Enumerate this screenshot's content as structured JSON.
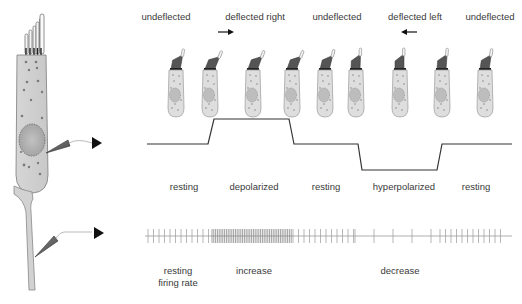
{
  "deflection_labels": [
    {
      "text": "undeflected",
      "x": 166
    },
    {
      "text": "deflected right",
      "x": 255
    },
    {
      "text": "undeflected",
      "x": 337
    },
    {
      "text": "deflected left",
      "x": 415
    },
    {
      "text": "undeflected",
      "x": 490
    }
  ],
  "deflection_arrows": [
    {
      "direction": "right",
      "x": 226,
      "y": 32
    },
    {
      "direction": "left",
      "x": 409,
      "y": 32
    }
  ],
  "potential_labels": [
    {
      "text": "resting",
      "x": 184
    },
    {
      "text": "depolarized",
      "x": 254
    },
    {
      "text": "resting",
      "x": 326
    },
    {
      "text": "hyperpolarized",
      "x": 404
    },
    {
      "text": "resting",
      "x": 476
    }
  ],
  "firing_labels": [
    {
      "text": "resting",
      "line2": "firing rate",
      "x": 178
    },
    {
      "text": "increase",
      "x": 254
    },
    {
      "text": "decrease",
      "x": 400
    }
  ],
  "receptor_potential_trace": {
    "baseline_y": 144,
    "depolarized_y": 119,
    "hyperpolarized_y": 170,
    "points": [
      [
        147,
        144
      ],
      [
        208,
        144
      ],
      [
        214,
        119
      ],
      [
        289,
        119
      ],
      [
        294,
        144
      ],
      [
        358,
        144
      ],
      [
        362,
        170
      ],
      [
        437,
        170
      ],
      [
        442,
        144
      ],
      [
        512,
        144
      ]
    ]
  },
  "spike_train": {
    "y": 236,
    "x_start": 145,
    "x_end": 512,
    "segments": [
      {
        "from": 148,
        "to": 212,
        "interval": 5.5,
        "label": "resting"
      },
      {
        "from": 212,
        "to": 293,
        "interval": 1.8,
        "label": "increase"
      },
      {
        "from": 293,
        "to": 355,
        "interval": 5.5,
        "label": "resting"
      },
      {
        "from": 355,
        "to": 440,
        "interval": 19,
        "label": "decrease"
      },
      {
        "from": 440,
        "to": 505,
        "interval": 5.5,
        "label": "resting"
      }
    ]
  },
  "small_cells": [
    {
      "x": 176,
      "tilt": 10
    },
    {
      "x": 210,
      "tilt": 22
    },
    {
      "x": 253,
      "tilt": 20
    },
    {
      "x": 292,
      "tilt": 20
    },
    {
      "x": 325,
      "tilt": 14
    },
    {
      "x": 356,
      "tilt": 2
    },
    {
      "x": 400,
      "tilt": 0
    },
    {
      "x": 442,
      "tilt": 4
    },
    {
      "x": 485,
      "tilt": 8
    }
  ],
  "electrodes": [
    {
      "name": "hair-cell-electrode",
      "target": "receptor potential",
      "arrow_x": 100,
      "arrow_y": 143
    },
    {
      "name": "afferent-fiber-electrode",
      "target": "spike train",
      "arrow_x": 101,
      "arrow_y": 233
    }
  ]
}
